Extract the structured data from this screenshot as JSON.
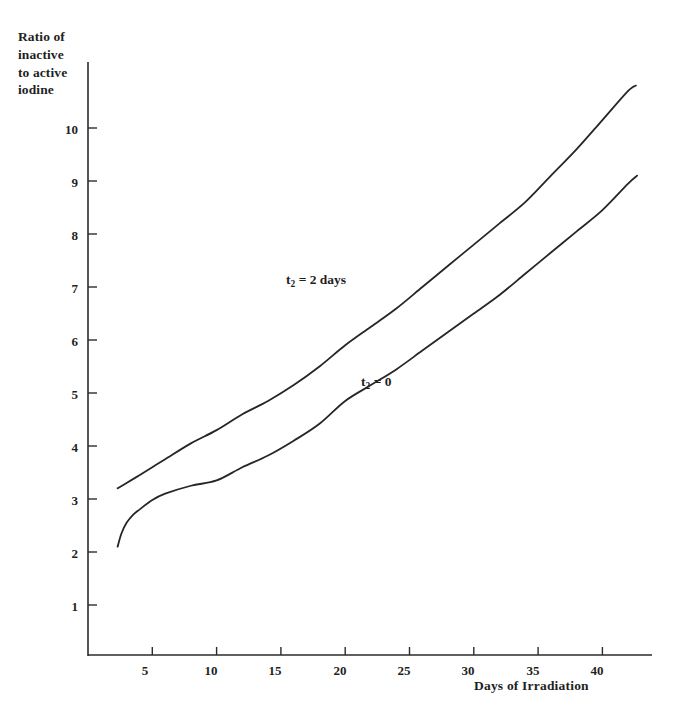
{
  "chart_data": {
    "type": "line",
    "title": "",
    "ylabel": "Ratio of inactive to active iodine",
    "ylabel_lines": [
      "Ratio of",
      "inactive",
      "to active",
      "iodine"
    ],
    "xlabel": "Days of Irradiation",
    "xlim": [
      0,
      43
    ],
    "ylim": [
      0,
      11.2
    ],
    "grid": false,
    "legend_position": "inline-annotations",
    "xticks": [
      5,
      10,
      15,
      20,
      25,
      30,
      35,
      40
    ],
    "xtick_labels": [
      "5",
      "10",
      "15",
      "20",
      "25",
      "30",
      "35",
      "40"
    ],
    "yticks": [
      1,
      2,
      3,
      4,
      5,
      6,
      7,
      8,
      9,
      10
    ],
    "ytick_labels": [
      "1",
      "2",
      "3",
      "4",
      "5",
      "6",
      "7",
      "8",
      "9",
      "10"
    ],
    "series": [
      {
        "name": "t2 = 2 days",
        "label_text": "t",
        "label_sub": "2",
        "label_rest": " = 2 days",
        "color": "#262626",
        "x": [
          2.3,
          3,
          4,
          5,
          6,
          8,
          10,
          12,
          14,
          16,
          18,
          20,
          22,
          24,
          26,
          28,
          30,
          32,
          34,
          36,
          38,
          40,
          42,
          42.6
        ],
        "y": [
          3.2,
          3.3,
          3.45,
          3.6,
          3.75,
          4.05,
          4.3,
          4.6,
          4.85,
          5.15,
          5.5,
          5.9,
          6.25,
          6.6,
          7.0,
          7.4,
          7.8,
          8.2,
          8.6,
          9.1,
          9.6,
          10.15,
          10.7,
          10.8
        ]
      },
      {
        "name": "t2 = 0",
        "label_text": "t",
        "label_sub": "2",
        "label_rest": " = 0",
        "color": "#262626",
        "x": [
          2.3,
          2.6,
          3,
          3.5,
          4,
          5,
          6,
          8,
          10,
          12,
          14,
          16,
          18,
          20,
          22,
          24,
          26,
          28,
          30,
          32,
          34,
          36,
          38,
          40,
          42,
          42.7
        ],
        "y": [
          2.1,
          2.35,
          2.55,
          2.7,
          2.8,
          2.98,
          3.1,
          3.25,
          3.35,
          3.6,
          3.82,
          4.1,
          4.42,
          4.85,
          5.15,
          5.45,
          5.8,
          6.15,
          6.5,
          6.85,
          7.25,
          7.65,
          8.05,
          8.45,
          8.95,
          9.1
        ]
      }
    ],
    "annotations": [
      {
        "name": "upper-curve-annotation",
        "x": 18.5,
        "y": 7.0
      },
      {
        "name": "lower-curve-annotation",
        "x": 23.5,
        "y": 5.1
      }
    ]
  }
}
